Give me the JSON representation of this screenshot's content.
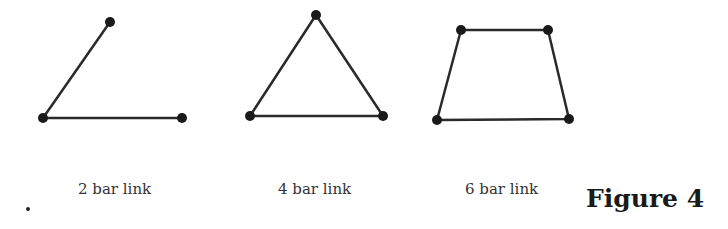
{
  "figure": {
    "title": "Figure 4",
    "stroke_color": "#2a2a2a",
    "joint_color": "#1a1a1a"
  },
  "diagrams": [
    {
      "label": "2 bar link",
      "joints": [
        [
          110,
          22
        ],
        [
          43,
          118
        ],
        [
          182,
          118
        ]
      ],
      "links": [
        [
          0,
          1
        ],
        [
          1,
          2
        ]
      ]
    },
    {
      "label": "4 bar link",
      "joints": [
        [
          316,
          15
        ],
        [
          250,
          116
        ],
        [
          383,
          116
        ]
      ],
      "links": [
        [
          0,
          1
        ],
        [
          1,
          2
        ],
        [
          2,
          0
        ]
      ]
    },
    {
      "label": "6 bar link",
      "joints": [
        [
          461,
          30
        ],
        [
          548,
          30
        ],
        [
          569,
          119
        ],
        [
          437,
          120
        ]
      ],
      "links": [
        [
          0,
          1
        ],
        [
          1,
          2
        ],
        [
          2,
          3
        ],
        [
          3,
          0
        ]
      ]
    }
  ]
}
